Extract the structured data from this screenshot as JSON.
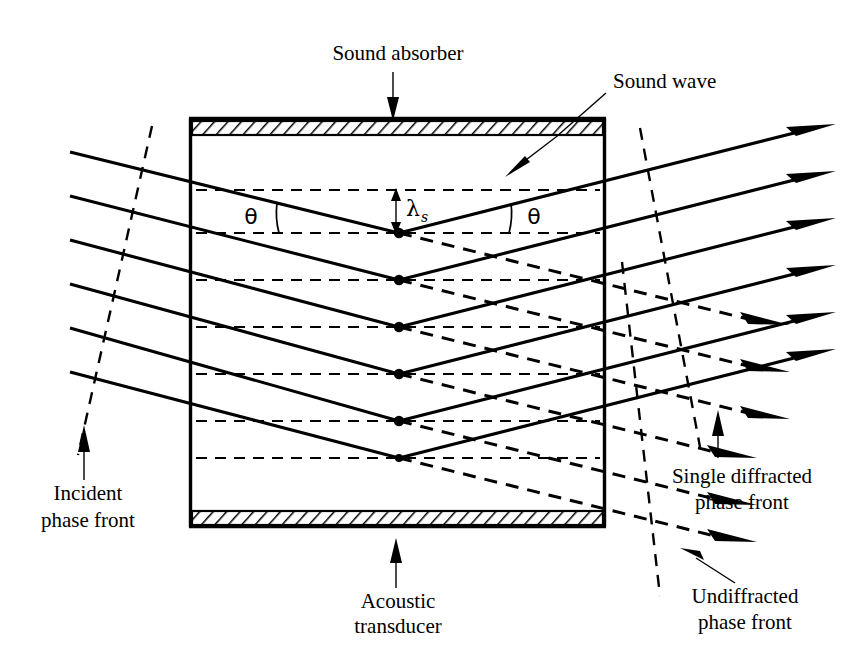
{
  "figure": {
    "width": 854,
    "height": 656,
    "background": "#ffffff",
    "ink_color": "#000000"
  },
  "labels": {
    "sound_absorber": "Sound absorber",
    "sound_wave": "Sound wave",
    "acoustic_transducer_line1": "Acoustic",
    "acoustic_transducer_line2": "transducer",
    "incident_line1": "Incident",
    "incident_line2": "phase front",
    "single_diffracted_line1": "Single diffracted",
    "single_diffracted_line2": "phase front",
    "undiffracted_line1": "Undiffracted",
    "undiffracted_line2": "phase front",
    "theta_left": "θ",
    "theta_right": "θ",
    "lambda_symbol": "λ",
    "lambda_subscript": "s"
  },
  "geometry": {
    "cell": {
      "left": 190,
      "right": 605,
      "top": 118,
      "bottom": 527
    },
    "absorber_top": {
      "x": 190,
      "y": 119,
      "width": 415,
      "height": 14
    },
    "absorber_bottom": {
      "x": 190,
      "y": 512,
      "width": 415,
      "height": 14
    },
    "scatter_column_x": 399,
    "scatter_nodes_y": [
      233,
      280,
      327,
      374,
      421,
      458
    ],
    "dashed_axis_y": [
      190,
      233,
      280,
      327,
      374,
      421,
      458
    ],
    "incident_ray_start_x": 70,
    "incident_ray_start_y": [
      152,
      196,
      240,
      284,
      328,
      372
    ],
    "exit_ray_end_x": 836,
    "ray_slope_down": 0.205,
    "ray_slope_up": -0.205
  },
  "annotations": {
    "theta_left_pos": {
      "x": 251,
      "y": 224
    },
    "theta_right_pos": {
      "x": 527,
      "y": 224
    },
    "lambda_pos": {
      "x": 409,
      "y": 215
    },
    "lambda_measure": {
      "x": 396,
      "y_top": 190,
      "y_bottom": 233
    },
    "sound_absorber_pos": {
      "x": 398,
      "y": 60
    },
    "sound_wave_pos": {
      "x": 613,
      "y": 88
    },
    "acoustic_transducer_pos": {
      "x": 398,
      "y": 608
    },
    "incident_front_pos": {
      "x": 88,
      "y": 500
    },
    "single_diffracted_pos": {
      "x": 737,
      "y": 476
    },
    "undiffracted_pos": {
      "x": 740,
      "y": 600
    }
  },
  "phase_fronts": [
    {
      "name": "incident-phase-front",
      "x1": 152,
      "y1": 126,
      "x2": 78,
      "y2": 455,
      "style": "dashed"
    },
    {
      "name": "single-diffracted-phase-front",
      "x1": 640,
      "y1": 128,
      "x2": 697,
      "y2": 440,
      "style": "dashed"
    },
    {
      "name": "undiffracted-phase-front",
      "x1": 622,
      "y1": 265,
      "x2": 658,
      "y2": 592,
      "style": "dashed"
    }
  ]
}
